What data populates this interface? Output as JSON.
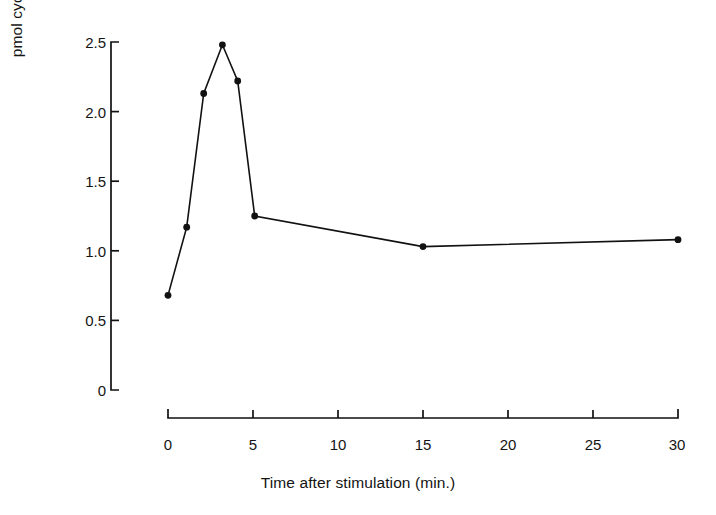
{
  "chart_data": {
    "type": "line",
    "title": "",
    "subtitle": "",
    "xlabel": "Time after stimulation (min.)",
    "ylabel": "pmol cyclic AMP per tubule",
    "xlim": [
      0,
      30
    ],
    "ylim": [
      0,
      2.5
    ],
    "xticks": [
      0,
      5,
      10,
      15,
      20,
      25,
      30
    ],
    "xtick_labels": [
      "0",
      "5",
      "10",
      "15",
      "20",
      "25",
      "30"
    ],
    "yticks": [
      0,
      0.5,
      1.0,
      1.5,
      2.0,
      2.5
    ],
    "ytick_labels": [
      "0",
      "0.5",
      "1.0",
      "1.5",
      "2.0",
      "2.5"
    ],
    "grid": false,
    "legend": false,
    "legend_position": "none",
    "marker": "filled-circle",
    "line_color": "#111111",
    "series": [
      {
        "name": "cyclic AMP",
        "x": [
          0,
          1.1,
          2.1,
          3.2,
          4.1,
          5.1,
          15.0,
          30.0
        ],
        "y": [
          0.68,
          1.17,
          2.13,
          2.48,
          2.22,
          1.25,
          1.03,
          1.08
        ]
      }
    ],
    "annotations": []
  },
  "axes": {
    "y_title": "pmol cyclic AMP per tubule",
    "x_title": "Time after stimulation (min.)"
  }
}
